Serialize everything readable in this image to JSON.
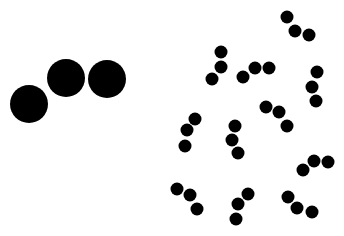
{
  "canvas": {
    "width": 344,
    "height": 236,
    "background": "#ffffff",
    "fill": "#000000"
  },
  "large_dots": [
    {
      "cx": 29,
      "cy": 104,
      "r": 19
    },
    {
      "cx": 66,
      "cy": 78,
      "r": 19
    },
    {
      "cx": 107,
      "cy": 79,
      "r": 19
    }
  ],
  "small_dot_radius": 6.5,
  "small_dot_groups": [
    [
      {
        "cx": 287,
        "cy": 17
      },
      {
        "cx": 295,
        "cy": 31
      },
      {
        "cx": 309,
        "cy": 35
      }
    ],
    [
      {
        "cx": 221,
        "cy": 52
      },
      {
        "cx": 221,
        "cy": 67
      },
      {
        "cx": 212,
        "cy": 79
      }
    ],
    [
      {
        "cx": 243,
        "cy": 77
      },
      {
        "cx": 255,
        "cy": 68
      },
      {
        "cx": 269,
        "cy": 68
      }
    ],
    [
      {
        "cx": 317,
        "cy": 72
      },
      {
        "cx": 312,
        "cy": 87
      },
      {
        "cx": 316,
        "cy": 101
      }
    ],
    [
      {
        "cx": 266,
        "cy": 107
      },
      {
        "cx": 279,
        "cy": 112
      },
      {
        "cx": 287,
        "cy": 126
      }
    ],
    [
      {
        "cx": 195,
        "cy": 119
      },
      {
        "cx": 187,
        "cy": 130
      },
      {
        "cx": 185,
        "cy": 146
      }
    ],
    [
      {
        "cx": 235,
        "cy": 126
      },
      {
        "cx": 232,
        "cy": 140
      },
      {
        "cx": 238,
        "cy": 153
      }
    ],
    [
      {
        "cx": 303,
        "cy": 170
      },
      {
        "cx": 314,
        "cy": 161
      },
      {
        "cx": 328,
        "cy": 162
      }
    ],
    [
      {
        "cx": 177,
        "cy": 189
      },
      {
        "cx": 190,
        "cy": 195
      },
      {
        "cx": 197,
        "cy": 209
      }
    ],
    [
      {
        "cx": 248,
        "cy": 194
      },
      {
        "cx": 238,
        "cy": 204
      },
      {
        "cx": 236,
        "cy": 219
      }
    ],
    [
      {
        "cx": 288,
        "cy": 197
      },
      {
        "cx": 297,
        "cy": 208
      },
      {
        "cx": 312,
        "cy": 212
      }
    ]
  ]
}
